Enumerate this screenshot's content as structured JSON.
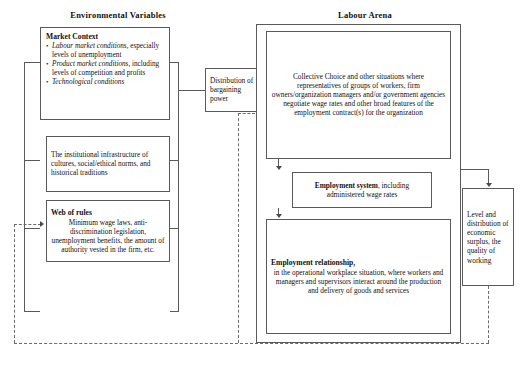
{
  "diagram": {
    "headings": {
      "left": "Environmental Variables",
      "right": "Labour Arena"
    },
    "boxes": {
      "market_context": {
        "title": "Market Context",
        "bullets": [
          {
            "em": "Labour market conditions,",
            "rest": " especially levels of unemployment"
          },
          {
            "em": "Product market conditions,",
            "rest": " including levels of competition and profits"
          },
          {
            "em": "Technological conditions",
            "rest": ""
          }
        ]
      },
      "institutional": {
        "text": "The institutional infrastructure of cultures, social/ethical norms, and historical traditions"
      },
      "web_of_rules": {
        "title": "Web of rules",
        "text": "Minimum wage laws, anti-discrimination legislation, unemployment benefits, the amount of authority vested in the firm, etc."
      },
      "bargaining": {
        "text": "Distribution of bargaining power"
      },
      "collective_choice": {
        "text": "Collective Choice and other situations where representatives of groups of workers, firm owners/organization managers and/or government agencies negotiate wage rates and other broad features of the employment contract(s) for the organization"
      },
      "employment_system": {
        "title": "Employment system",
        "rest": ", including administered wage rates"
      },
      "employment_relationship": {
        "title": "Employment relationship,",
        "text": "in the operational workplace situation, where workers and managers and supervisors interact around the production and delivery of goods and services"
      },
      "outcomes": {
        "text": "Level and distribution of economic surplus, the quality of working"
      }
    },
    "colors": {
      "stroke": "#5a5a5a",
      "dashed": "#6b6b6b",
      "arrow": "#4a4a4a",
      "background": "#ffffff"
    }
  }
}
